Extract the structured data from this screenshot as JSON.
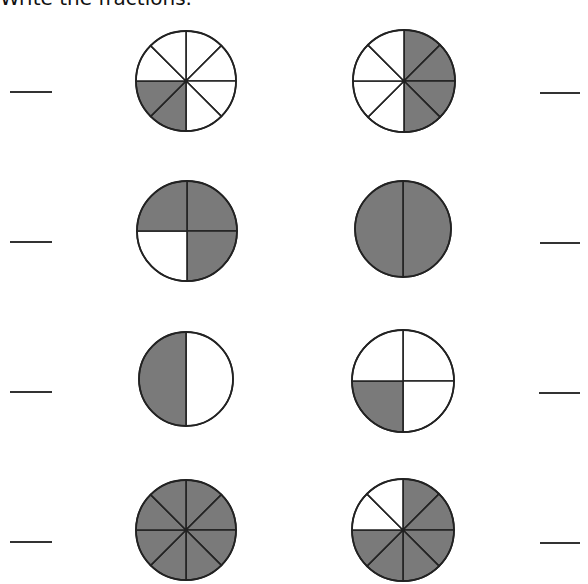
{
  "instruction": "Write the fractions.",
  "style": {
    "shade_color": "#7a7a7a",
    "line_color": "#222222",
    "empty_color": "#ffffff"
  },
  "problems": [
    {
      "id": 1,
      "cx": 186,
      "cy": 81,
      "r": 50,
      "divisions": 8,
      "shaded": [
        4,
        5
      ],
      "answer": "",
      "line": {
        "x": 10,
        "y": 91,
        "w": 42
      }
    },
    {
      "id": 2,
      "cx": 404,
      "cy": 81,
      "r": 51,
      "divisions": 8,
      "shaded": [
        0,
        1,
        2,
        3
      ],
      "answer": "",
      "line": {
        "x": 540,
        "y": 92,
        "w": 40
      }
    },
    {
      "id": 3,
      "cx": 187,
      "cy": 231,
      "r": 50,
      "divisions": 4,
      "shaded": [
        0,
        1,
        3
      ],
      "answer": "",
      "line": {
        "x": 10,
        "y": 241,
        "w": 42
      }
    },
    {
      "id": 4,
      "cx": 403,
      "cy": 229,
      "r": 48,
      "divisions": 2,
      "shaded": [
        0,
        1
      ],
      "answer": "",
      "line": {
        "x": 540,
        "y": 242,
        "w": 40
      }
    },
    {
      "id": 5,
      "cx": 186,
      "cy": 379,
      "r": 47,
      "divisions": 2,
      "shaded": [
        1
      ],
      "answer": "",
      "line": {
        "x": 10,
        "y": 391,
        "w": 42
      }
    },
    {
      "id": 6,
      "cx": 403,
      "cy": 381,
      "r": 51,
      "divisions": 4,
      "shaded": [
        2
      ],
      "answer": "",
      "line": {
        "x": 539,
        "y": 392,
        "w": 41
      }
    },
    {
      "id": 7,
      "cx": 186,
      "cy": 530,
      "r": 50,
      "divisions": 8,
      "shaded": [
        0,
        1,
        2,
        3,
        4,
        5,
        6,
        7
      ],
      "answer": "",
      "line": {
        "x": 10,
        "y": 541,
        "w": 42
      }
    },
    {
      "id": 8,
      "cx": 403,
      "cy": 530,
      "r": 51,
      "divisions": 8,
      "shaded": [
        0,
        1,
        2,
        3,
        4,
        5
      ],
      "answer": "",
      "line": {
        "x": 540,
        "y": 542,
        "w": 40
      }
    }
  ]
}
